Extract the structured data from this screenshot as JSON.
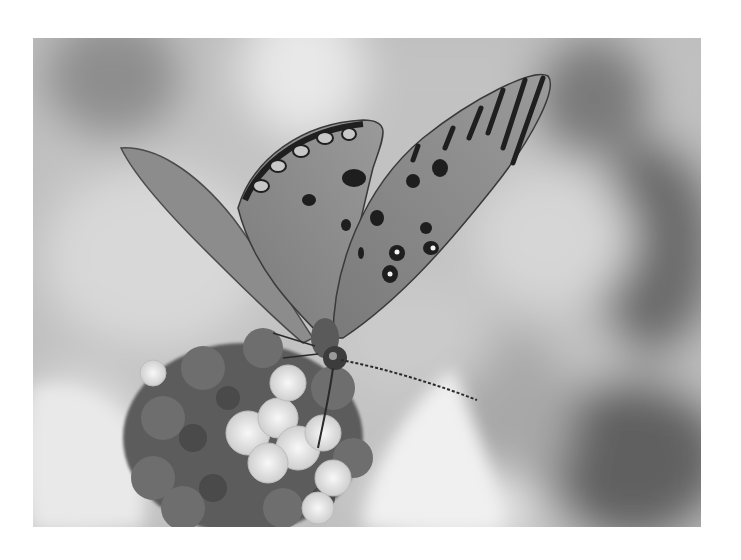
{
  "image": {
    "subject": "Butterfly on flower cluster (grayscale photo)",
    "palette": {
      "background": "#ffffff",
      "blur_light": "#e6e6e6",
      "blur_mid": "#b4b4b4",
      "blur_dark": "#6e6e6e",
      "wing": "#8a8a8a",
      "wing_mark": "#1e1e1e",
      "flower_light": "#eeeeee",
      "flower_dark": "#555555"
    }
  }
}
